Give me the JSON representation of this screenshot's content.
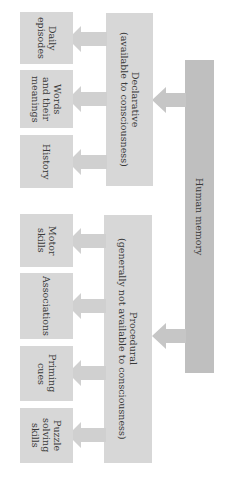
{
  "diagram": {
    "root": {
      "label": "Human memory",
      "color": "#bfbfbf"
    },
    "branches": [
      {
        "label": "Declarative\n(available to consciousness)",
        "color": "#d7d7d7",
        "children": [
          {
            "label": "Daily\nepisodes"
          },
          {
            "label": "Words\nand their\nmeanings"
          },
          {
            "label": "History"
          }
        ]
      },
      {
        "label": "Procedural\n(generally not available to consciousness)",
        "color": "#d7d7d7",
        "children": [
          {
            "label": "Motor\nskills"
          },
          {
            "label": "Associations"
          },
          {
            "label": "Priming\ncues"
          },
          {
            "label": "Puzzle\nsolving\nskills"
          }
        ]
      }
    ],
    "arrow_color": "#d0d0d0"
  }
}
